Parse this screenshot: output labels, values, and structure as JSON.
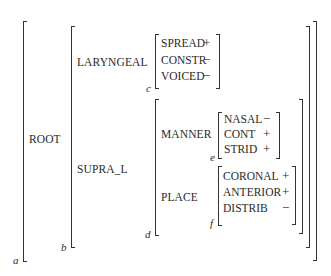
{
  "diagram": {
    "type": "feature-geometry matrix",
    "root": {
      "label": "ROOT",
      "index": "a",
      "children": {
        "laryngeal": {
          "label": "LARYNGEAL",
          "index": "c",
          "features": [
            {
              "name": "SPREAD",
              "value": "+"
            },
            {
              "name": "CONSTR",
              "value": "−"
            },
            {
              "name": "VOICED",
              "value": "−"
            }
          ]
        },
        "supra": {
          "label": "SUPRA_L",
          "index": "b",
          "inner_index": "d",
          "manner": {
            "label": "MANNER",
            "index": "e",
            "features": [
              {
                "name": "NASAL",
                "value": "−"
              },
              {
                "name": "CONT",
                "value": "+"
              },
              {
                "name": "STRID",
                "value": "+"
              }
            ]
          },
          "place": {
            "label": "PLACE",
            "index": "f",
            "features": [
              {
                "name": "CORONAL",
                "value": "+"
              },
              {
                "name": "ANTERIOR",
                "value": "+"
              },
              {
                "name": "DISTRIB",
                "value": "−"
              }
            ]
          }
        }
      }
    }
  }
}
